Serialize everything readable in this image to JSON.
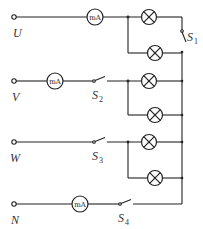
{
  "diagram": {
    "type": "circuit",
    "terminals": [
      {
        "id": "U",
        "label": "U"
      },
      {
        "id": "V",
        "label": "V"
      },
      {
        "id": "W",
        "label": "W"
      },
      {
        "id": "N",
        "label": "N"
      }
    ],
    "meters": [
      {
        "id": "meter-u",
        "label": "mA",
        "line": "U"
      },
      {
        "id": "meter-v",
        "label": "mA",
        "line": "V"
      },
      {
        "id": "meter-n",
        "label": "mA",
        "line": "N"
      }
    ],
    "switches": [
      {
        "id": "S1",
        "letter": "S",
        "sub": "1",
        "location": "right bus between U lamps"
      },
      {
        "id": "S2",
        "letter": "S",
        "sub": "2",
        "line": "V"
      },
      {
        "id": "S3",
        "letter": "S",
        "sub": "3",
        "line": "W"
      },
      {
        "id": "S4",
        "letter": "S",
        "sub": "4",
        "line": "N"
      }
    ],
    "lamps": [
      {
        "id": "lamp-u1",
        "line": "U"
      },
      {
        "id": "lamp-u2",
        "line": "U"
      },
      {
        "id": "lamp-v1",
        "line": "V"
      },
      {
        "id": "lamp-v2",
        "line": "V"
      },
      {
        "id": "lamp-w1",
        "line": "W"
      },
      {
        "id": "lamp-w2",
        "line": "W"
      }
    ]
  }
}
